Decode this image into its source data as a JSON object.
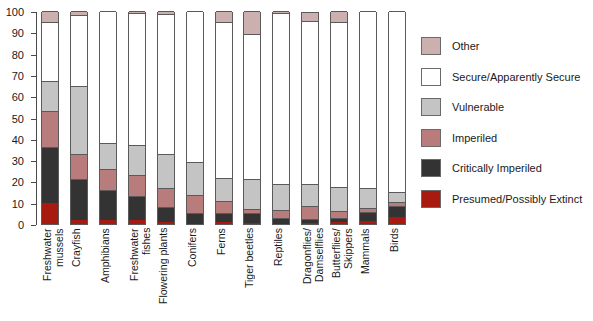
{
  "chart_data": {
    "type": "bar",
    "subtype": "stacked-bar-100",
    "title": "",
    "xlabel": "",
    "ylabel": "",
    "ylim": [
      0,
      100
    ],
    "yticks": [
      0,
      10,
      20,
      30,
      40,
      50,
      60,
      70,
      80,
      90,
      100
    ],
    "ytick_labels": [
      "0",
      "10",
      "20",
      "30",
      "40",
      "50",
      "60",
      "70",
      "80",
      "90",
      "100"
    ],
    "grid": false,
    "legend_position": "right",
    "categories": [
      "Freshwater\nmussels",
      "Crayfish",
      "Amphibians",
      "Freshwater\nfishes",
      "Flowering plants",
      "Conifers",
      "Ferns",
      "Tiger beetles",
      "Reptiles",
      "Dragonflies/\nDamselflies",
      "Butterflies/\nSkippers",
      "Mammals",
      "Birds"
    ],
    "stack_order_bottom_to_top": [
      "Presumed/Possibly Extinct",
      "Critically Imperiled",
      "Imperiled",
      "Vulnerable",
      "Secure/Apparently Secure",
      "Other"
    ],
    "series": [
      {
        "name": "Presumed/Possibly Extinct",
        "color": "#a81a10",
        "values": [
          10,
          2,
          2,
          2,
          1,
          0,
          1,
          0.5,
          0,
          0.5,
          1,
          1.5,
          3.5
        ]
      },
      {
        "name": "Critically Imperiled",
        "color": "#333333",
        "values": [
          26,
          19,
          14,
          11,
          7,
          5,
          4,
          4.5,
          3,
          2,
          2,
          4,
          5
        ]
      },
      {
        "name": "Imperiled",
        "color": "#b97c7c",
        "values": [
          17,
          12,
          10,
          10,
          9,
          8.5,
          6,
          2,
          3.5,
          6,
          3,
          2,
          2
        ]
      },
      {
        "name": "Vulnerable",
        "color": "#c4c4c4",
        "values": [
          14,
          32,
          12,
          14,
          16,
          15.5,
          10.5,
          14,
          12.5,
          10.5,
          11.5,
          9.5,
          4.5
        ]
      },
      {
        "name": "Secure/Apparently Secure",
        "color": "#ffffff",
        "values": [
          28,
          33,
          62,
          62,
          65.5,
          71,
          73.5,
          68,
          80,
          76.5,
          77.5,
          83,
          85
        ]
      },
      {
        "name": "Other",
        "color": "#ccb0b0",
        "values": [
          5,
          2,
          0,
          1,
          1.5,
          0,
          5,
          11,
          1,
          4,
          5,
          0,
          0
        ]
      }
    ]
  },
  "legend": {
    "entries": [
      {
        "label": "Other",
        "color": "#ccb0b0"
      },
      {
        "label": "Secure/Apparently Secure",
        "color": "#ffffff"
      },
      {
        "label": "Vulnerable",
        "color": "#c4c4c4"
      },
      {
        "label": "Imperiled",
        "color": "#b97c7c"
      },
      {
        "label": "Critically Imperiled",
        "color": "#333333"
      },
      {
        "label": "Presumed/Possibly Extinct",
        "color": "#a81a10"
      }
    ]
  },
  "colors": {
    "axis": "#4a4a4a",
    "bar_outline": "#5a5a5a",
    "background": "#ffffff",
    "text": "#1a1a1a"
  }
}
